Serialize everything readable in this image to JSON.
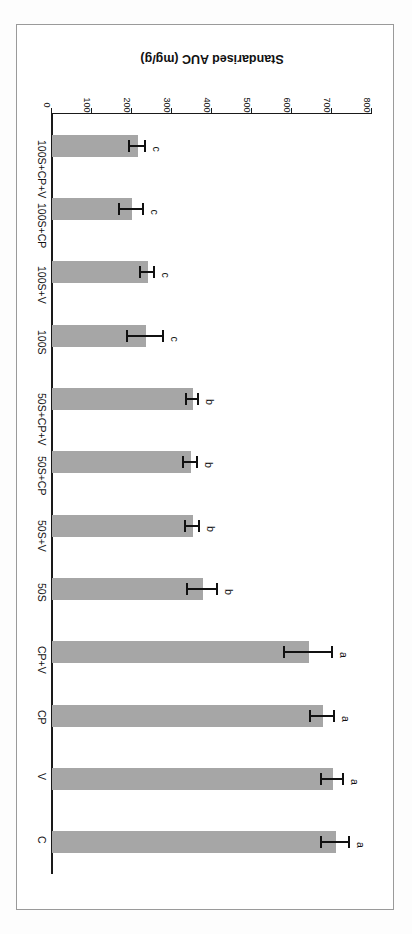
{
  "figure": {
    "orientation": "rotated-180",
    "bar_color": "#a6a6a6",
    "axis_color": "#1a1a1a"
  },
  "chart_data": {
    "type": "bar",
    "title": "",
    "xlabel": "",
    "ylabel": "Standarised AUC (mg/g)",
    "ylim": [
      0,
      800
    ],
    "ytick_labels": [
      "0",
      "100",
      "200",
      "300",
      "400",
      "500",
      "600",
      "700",
      "800"
    ],
    "yticks": [
      0,
      100,
      200,
      300,
      400,
      500,
      600,
      700,
      800
    ],
    "grid": false,
    "legend": "none",
    "categories": [
      "C",
      "V",
      "CP",
      "CP+V",
      "50S",
      "50S+V",
      "50S+CP",
      "50S+CP+V",
      "100S",
      "100S+V",
      "100S+CP",
      "100S+CP+V"
    ],
    "values": [
      710,
      703,
      678,
      643,
      378,
      352,
      348,
      352,
      235,
      240,
      200,
      215
    ],
    "errors": [
      35,
      28,
      30,
      60,
      38,
      17,
      18,
      15,
      45,
      18,
      30,
      20
    ],
    "annotations": [
      "a",
      "a",
      "a",
      "a",
      "b",
      "b",
      "b",
      "b",
      "c",
      "c",
      "c",
      "c"
    ],
    "annotation_note": "letters denote significance groupings"
  }
}
